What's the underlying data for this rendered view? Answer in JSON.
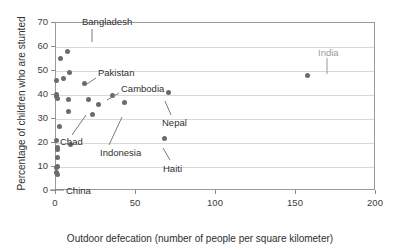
{
  "chart_data": {
    "type": "scatter",
    "title": "",
    "xlabel": "Outdoor defecation (number of people per square kilometer)",
    "ylabel": "Percentage of children who are stunted",
    "xlim": [
      0,
      200
    ],
    "ylim": [
      0,
      70
    ],
    "xticks": [
      0,
      50,
      100,
      150,
      200
    ],
    "yticks": [
      0,
      10,
      20,
      30,
      40,
      50,
      60,
      70
    ],
    "grid": "horizontal",
    "legend": "none",
    "points": [
      {
        "x": 0.3,
        "y": 46.0,
        "label": ""
      },
      {
        "x": 3.0,
        "y": 55.2,
        "label": ""
      },
      {
        "x": 4.5,
        "y": 47.0,
        "label": ""
      },
      {
        "x": 7.0,
        "y": 58.0,
        "label": "Bangladesh"
      },
      {
        "x": 8.5,
        "y": 49.2,
        "label": ""
      },
      {
        "x": 17.5,
        "y": 45.0,
        "label": "Pakistan"
      },
      {
        "x": 35.0,
        "y": 40.0,
        "label": "Cambodia"
      },
      {
        "x": 70.0,
        "y": 41.0,
        "label": "Nepal"
      },
      {
        "x": 0.4,
        "y": 40.2,
        "label": ""
      },
      {
        "x": 0.6,
        "y": 39.2,
        "label": ""
      },
      {
        "x": 1.0,
        "y": 38.6,
        "label": ""
      },
      {
        "x": 8.0,
        "y": 38.2,
        "label": ""
      },
      {
        "x": 20.0,
        "y": 38.3,
        "label": ""
      },
      {
        "x": 26.5,
        "y": 36.2,
        "label": ""
      },
      {
        "x": 43.0,
        "y": 37.0,
        "label": ""
      },
      {
        "x": 7.5,
        "y": 33.0,
        "label": "Chad"
      },
      {
        "x": 22.5,
        "y": 32.0,
        "label": "Indonesia"
      },
      {
        "x": 2.0,
        "y": 27.0,
        "label": ""
      },
      {
        "x": 0.5,
        "y": 21.2,
        "label": ""
      },
      {
        "x": 9.0,
        "y": 19.2,
        "label": ""
      },
      {
        "x": 68.0,
        "y": 22.0,
        "label": "Haiti"
      },
      {
        "x": 0.8,
        "y": 18.0,
        "label": ""
      },
      {
        "x": 0.8,
        "y": 17.2,
        "label": ""
      },
      {
        "x": 0.9,
        "y": 13.8,
        "label": ""
      },
      {
        "x": 0.7,
        "y": 10.2,
        "label": "China"
      },
      {
        "x": 0.6,
        "y": 9.6,
        "label": ""
      },
      {
        "x": 0.5,
        "y": 7.6,
        "label": ""
      },
      {
        "x": 0.9,
        "y": 7.0,
        "label": ""
      },
      {
        "x": 157.0,
        "y": 48.0,
        "label": "India"
      }
    ],
    "annotations": [
      {
        "name": "bangladesh",
        "text": "Bangladesh",
        "label_x": 82,
        "label_y": 17,
        "line": [
          92,
          29,
          92,
          42
        ],
        "muted": false
      },
      {
        "name": "pakistan",
        "text": "Pakistan",
        "label_x": 98,
        "label_y": 68,
        "line": [
          96,
          78,
          84,
          86
        ],
        "muted": false
      },
      {
        "name": "cambodia",
        "text": "Cambodia",
        "label_x": 121,
        "label_y": 84,
        "line": [
          119,
          93,
          107,
          100
        ],
        "muted": false
      },
      {
        "name": "nepal",
        "text": "Nepal",
        "label_x": 162,
        "label_y": 118,
        "line": [
          171,
          115,
          165,
          101
        ],
        "muted": false
      },
      {
        "name": "chad",
        "text": "Chad",
        "label_x": 60,
        "label_y": 137,
        "line": [
          72,
          135,
          86,
          115
        ],
        "muted": false
      },
      {
        "name": "indonesia",
        "text": "Indonesia",
        "label_x": 100,
        "label_y": 148,
        "line": [
          109,
          145,
          122,
          117
        ],
        "muted": false
      },
      {
        "name": "haiti",
        "text": "Haiti",
        "label_x": 163,
        "label_y": 164,
        "line": [
          170,
          160,
          163,
          148
        ],
        "muted": false
      },
      {
        "name": "china",
        "text": "China",
        "label_x": 66,
        "label_y": 186,
        "line": [
          64,
          190,
          50,
          190
        ],
        "muted": false
      },
      {
        "name": "india",
        "text": "India",
        "label_x": 318,
        "label_y": 48,
        "line": [
          327,
          58,
          327,
          74
        ],
        "muted": true
      }
    ]
  },
  "colors": {
    "point": "#6b6b6b",
    "grid": "#d8d8d8",
    "frame": "#9b9b9b",
    "text": "#2f2f2f",
    "muted_text": "#9a9a9a"
  }
}
